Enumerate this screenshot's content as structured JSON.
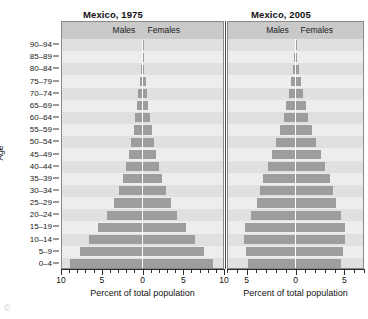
{
  "figure": {
    "y_axis_title": "Age",
    "bar_color": "#9d9d9d",
    "panel_background": "#e8e8e8",
    "header_background": "#c9c9c9",
    "age_groups": [
      "0–4",
      "5–9",
      "10–14",
      "15–19",
      "20–24",
      "25–29",
      "30–34",
      "35–39",
      "40–44",
      "45–49",
      "50–54",
      "55–59",
      "60–64",
      "65–69",
      "70–74",
      "75–79",
      "80–84",
      "85–89",
      "90–94"
    ],
    "header_labels": {
      "males": "Males",
      "females": "Females"
    },
    "x_axis_title": "Percent of total population"
  },
  "panels": [
    {
      "title": "Mexico, 1975",
      "xlabel": "Percent of total population",
      "xticks": [
        "10",
        "5",
        "0",
        "5",
        "10"
      ],
      "xlim": 10
    },
    {
      "title": "Mexico, 2005",
      "xlabel": "Percent of total population",
      "xticks": [
        "5",
        "0",
        "5"
      ],
      "xlim": 7
    }
  ],
  "page_artifact": "©",
  "chart_data": {
    "type": "bar",
    "xlabel": "Percent of total population",
    "ylabel": "Age",
    "grid": false,
    "legend": [
      "Males",
      "Females"
    ],
    "legend_position": "top",
    "categories": [
      "0–4",
      "5–9",
      "10–14",
      "15–19",
      "20–24",
      "25–29",
      "30–34",
      "35–39",
      "40–44",
      "45–49",
      "50–54",
      "55–59",
      "60–64",
      "65–69",
      "70–74",
      "75–79",
      "80–84",
      "85–89",
      "90–94"
    ],
    "charts": [
      {
        "name": "Mexico, 1975",
        "xlim": [
          -10,
          10
        ],
        "xticks": [
          -10,
          -5,
          0,
          5,
          10
        ],
        "series": [
          {
            "name": "Males",
            "values": [
              9.0,
              7.8,
              6.7,
              5.5,
              4.4,
              3.6,
              2.9,
              2.4,
              2.0,
              1.7,
              1.4,
              1.1,
              0.9,
              0.7,
              0.5,
              0.35,
              0.2,
              0.12,
              0.05
            ]
          },
          {
            "name": "Females",
            "values": [
              8.8,
              7.6,
              6.5,
              5.4,
              4.3,
              3.5,
              2.9,
              2.4,
              2.0,
              1.7,
              1.4,
              1.2,
              0.9,
              0.7,
              0.5,
              0.38,
              0.22,
              0.14,
              0.06
            ]
          }
        ]
      },
      {
        "name": "Mexico, 2005",
        "xlim": [
          -7,
          7
        ],
        "xticks": [
          -5,
          0,
          5
        ],
        "series": [
          {
            "name": "Males",
            "values": [
              4.9,
              5.1,
              5.3,
              5.2,
              4.6,
              4.0,
              3.7,
              3.4,
              2.9,
              2.4,
              2.0,
              1.6,
              1.2,
              0.95,
              0.7,
              0.5,
              0.3,
              0.15,
              0.06
            ]
          },
          {
            "name": "Females",
            "values": [
              4.7,
              4.9,
              5.1,
              5.1,
              4.7,
              4.2,
              3.9,
              3.6,
              3.1,
              2.6,
              2.1,
              1.7,
              1.3,
              1.05,
              0.8,
              0.55,
              0.35,
              0.18,
              0.08
            ]
          }
        ]
      }
    ]
  }
}
